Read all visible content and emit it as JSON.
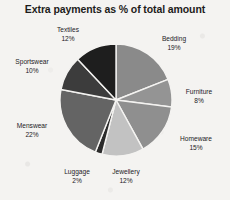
{
  "chart_data": {
    "type": "pie",
    "title": "Extra payments as % of total amount",
    "xlabel": "",
    "ylabel": "",
    "legend_position": "none",
    "grid": false,
    "value_unit": "%",
    "total": 100,
    "categories": [
      "Bedding",
      "Furniture",
      "Homeware",
      "Jewellery",
      "Luggage",
      "Menswear",
      "Sportswear",
      "Textiles"
    ],
    "values": [
      19,
      8,
      15,
      12,
      2,
      22,
      10,
      12
    ],
    "slices": [
      {
        "label": "Bedding",
        "value": 19,
        "pct_text": "19%",
        "color": "#8a8a8a"
      },
      {
        "label": "Furniture",
        "value": 8,
        "pct_text": "8%",
        "color": "#949494"
      },
      {
        "label": "Homeware",
        "value": 15,
        "pct_text": "15%",
        "color": "#8f8f8f"
      },
      {
        "label": "Jewellery",
        "value": 12,
        "pct_text": "12%",
        "color": "#c2c2c2"
      },
      {
        "label": "Luggage",
        "value": 2,
        "pct_text": "2%",
        "color": "#2b2b2b"
      },
      {
        "label": "Menswear",
        "value": 22,
        "pct_text": "22%",
        "color": "#646464"
      },
      {
        "label": "Sportswear",
        "value": 10,
        "pct_text": "10%",
        "color": "#3c3c3c"
      },
      {
        "label": "Textiles",
        "value": 12,
        "pct_text": "12%",
        "color": "#1e1e1e"
      }
    ],
    "colors": {
      "background": "#f4f3f1",
      "text": "#23211f",
      "slice_border": "#f4f3f1"
    }
  }
}
